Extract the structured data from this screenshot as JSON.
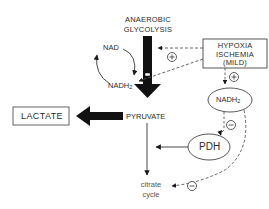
{
  "diagram": {
    "title_top": {
      "line1": "ANAEROBIC",
      "line2": "GLYCOLYSIS"
    },
    "nodes": {
      "nad": "NAD",
      "nadh2_left": "NADH",
      "nadh2_left_sub": "2",
      "hypoxia_box": {
        "line1": "HYPOXIA",
        "line2": "ISCHEMIA",
        "line3": "(MILD)"
      },
      "nadh2_right": "NADH",
      "nadh2_right_sub": "2",
      "lactate": "LACTATE",
      "pyruvate": "PYRUVATE",
      "pdh": "PDH",
      "citrate": {
        "line1": "citrate",
        "line2": "cycle"
      }
    },
    "signs": {
      "plus_glycolysis": "+",
      "plus_nadh": "+",
      "minus_pdh": "−",
      "minus_citrate": "−"
    },
    "colors": {
      "ink": "#1a1a1a",
      "line": "#333333",
      "dashed": "#555555",
      "background": "#ffffff"
    }
  }
}
